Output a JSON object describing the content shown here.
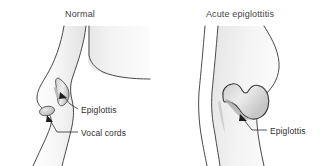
{
  "figure": {
    "kind": "medical-illustration",
    "background_color": "#ffffff",
    "outline_color": "#3a3a3a",
    "tissue_fill_light": "#f4f4f4",
    "tissue_fill_shadow": "#d9d9d9",
    "label_color": "#2f2f2f",
    "title_color": "#3f3f3f"
  },
  "panels": [
    {
      "id": "normal",
      "title": "Normal",
      "labels": [
        {
          "id": "epiglottis-normal",
          "text": "Epiglottis"
        },
        {
          "id": "vocal-cords",
          "text": "Vocal cords"
        }
      ]
    },
    {
      "id": "acute",
      "title": "Acute epiglottitis",
      "labels": [
        {
          "id": "epiglottis-acute",
          "text": "Epiglottis"
        }
      ]
    }
  ]
}
